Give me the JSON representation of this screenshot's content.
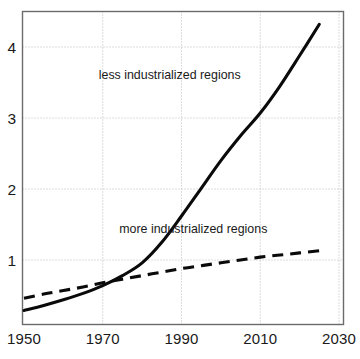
{
  "chart_data": {
    "type": "line",
    "title": "",
    "subtitle": "",
    "xlabel": "",
    "ylabel": "",
    "xlim": [
      1950,
      2030
    ],
    "ylim": [
      0,
      4.6
    ],
    "grid": true,
    "legend_position": "inline-annotations",
    "x_ticks": [
      "1950",
      "1970",
      "1990",
      "2010",
      "2030"
    ],
    "x_tick_values": [
      1950,
      1970,
      1990,
      2010,
      2030
    ],
    "y_ticks": [
      "1",
      "2",
      "3",
      "4"
    ],
    "y_tick_values": [
      1,
      2,
      3,
      4
    ],
    "series": [
      {
        "name": "less industrialized regions",
        "style": "solid",
        "color": "#0a0a0a",
        "label_x": 1987,
        "label_y": 3.55,
        "x": [
          1950,
          1955,
          1960,
          1965,
          1970,
          1975,
          1980,
          1985,
          1990,
          1995,
          2000,
          2005,
          2010,
          2015,
          2020,
          2025
        ],
        "values": [
          0.29,
          0.36,
          0.44,
          0.53,
          0.64,
          0.78,
          0.96,
          1.25,
          1.62,
          2.01,
          2.4,
          2.75,
          3.07,
          3.45,
          3.88,
          4.32
        ]
      },
      {
        "name": "more industrialized regions",
        "style": "dashed",
        "color": "#0a0a0a",
        "label_x": 1992,
        "label_y": 1.38,
        "x": [
          1950,
          1955,
          1960,
          1965,
          1970,
          1975,
          1980,
          1985,
          1990,
          1995,
          2000,
          2005,
          2010,
          2015,
          2020,
          2025
        ],
        "values": [
          0.46,
          0.52,
          0.57,
          0.62,
          0.68,
          0.73,
          0.78,
          0.83,
          0.88,
          0.92,
          0.96,
          1.0,
          1.04,
          1.07,
          1.1,
          1.13
        ]
      }
    ],
    "annotations": [
      {
        "text": "less industrialized regions",
        "x": 1987,
        "y": 3.55
      },
      {
        "text": "more industrialized regions",
        "x": 1993,
        "y": 1.38
      }
    ],
    "colors": {
      "curve": "#0a0a0a",
      "grid": "#b8b8b8",
      "axis": "#6b6b6b",
      "text": "#1a1a1a",
      "background": "#ffffff"
    }
  }
}
